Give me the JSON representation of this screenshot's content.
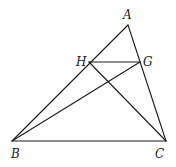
{
  "diagram": {
    "type": "geometry-triangle",
    "points": {
      "A": {
        "label": "A"
      },
      "B": {
        "label": "B"
      },
      "C": {
        "label": "C"
      },
      "H": {
        "label": "H",
        "on": "AB"
      },
      "G": {
        "label": "G",
        "on": "AC"
      }
    },
    "segments": [
      [
        "A",
        "B"
      ],
      [
        "A",
        "C"
      ],
      [
        "B",
        "C"
      ],
      [
        "H",
        "G"
      ],
      [
        "B",
        "G"
      ],
      [
        "H",
        "C"
      ]
    ],
    "relations": [
      "HG parallel to BC"
    ]
  }
}
